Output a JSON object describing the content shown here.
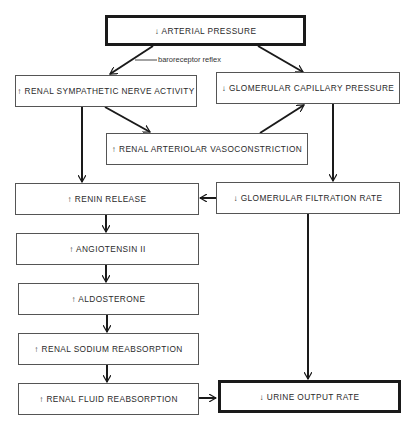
{
  "diagram": {
    "nodes": {
      "arterial_pressure": "↓ ARTERIAL PRESSURE",
      "renal_sympathetic": "↑ RENAL SYMPATHETIC NERVE ACTIVITY",
      "glomerular_capillary": "↓ GLOMERULAR CAPILLARY PRESSURE",
      "arteriolar_vasoconstriction": "↑ RENAL ARTERIOLAR VASOCONSTRICTION",
      "renin_release": "↑ RENIN RELEASE",
      "gfr": "↓ GLOMERULAR FILTRATION RATE",
      "angiotensin": "↑ ANGIOTENSIN II",
      "aldosterone": "↑ ALDOSTERONE",
      "sodium_reabsorption": "↑ RENAL SODIUM REABSORPTION",
      "fluid_reabsorption": "↑ RENAL FLUID REABSORPTION",
      "urine_output": "↓ URINE OUTPUT RATE"
    },
    "edge_labels": {
      "baroreceptor": "baroreceptor reflex"
    },
    "edges": [
      [
        "arterial_pressure",
        "renal_sympathetic"
      ],
      [
        "arterial_pressure",
        "glomerular_capillary"
      ],
      [
        "renal_sympathetic",
        "arteriolar_vasoconstriction"
      ],
      [
        "arteriolar_vasoconstriction",
        "glomerular_capillary"
      ],
      [
        "renal_sympathetic",
        "renin_release"
      ],
      [
        "glomerular_capillary",
        "gfr"
      ],
      [
        "gfr",
        "renin_release"
      ],
      [
        "renin_release",
        "angiotensin"
      ],
      [
        "angiotensin",
        "aldosterone"
      ],
      [
        "aldosterone",
        "sodium_reabsorption"
      ],
      [
        "sodium_reabsorption",
        "fluid_reabsorption"
      ],
      [
        "fluid_reabsorption",
        "urine_output"
      ],
      [
        "gfr",
        "urine_output"
      ]
    ]
  }
}
